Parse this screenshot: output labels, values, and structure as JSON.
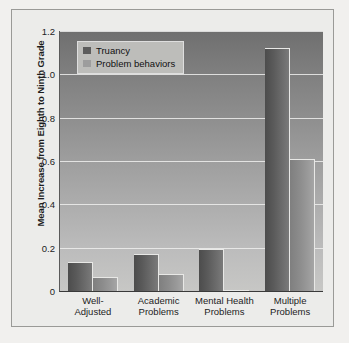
{
  "chart_data": {
    "type": "bar",
    "title": "",
    "xlabel": "",
    "ylabel": "Mean Increase from Eighth to Ninth Grade",
    "ylim": [
      0,
      1.2
    ],
    "yticks": [
      "0",
      "0.2",
      "0.4",
      "0.6",
      "0.8",
      "1.0",
      "1.2"
    ],
    "ytick_values": [
      0,
      0.2,
      0.4,
      0.6,
      0.8,
      1.0,
      1.2
    ],
    "grid": true,
    "legend_position": "top-left inside plot",
    "categories": [
      "Well-Adjusted",
      "Academic Problems",
      "Mental Health Problems",
      "Multiple Problems"
    ],
    "category_lines": [
      [
        "Well-",
        "Adjusted"
      ],
      [
        "Academic",
        "Problems"
      ],
      [
        "Mental Health",
        "Problems"
      ],
      [
        "Multiple",
        "Problems"
      ]
    ],
    "series": [
      {
        "name": "Truancy",
        "color": "#5c5c5c",
        "values": [
          0.135,
          0.17,
          0.195,
          1.12
        ]
      },
      {
        "name": "Problem behaviors",
        "color": "#9d9d9d",
        "values": [
          0.065,
          0.08,
          0.005,
          0.61
        ]
      }
    ]
  },
  "legend": {
    "items": [
      {
        "label": "Truancy"
      },
      {
        "label": "Problem behaviors"
      }
    ]
  },
  "colors": {
    "page_background": "#f1f0ee",
    "figure_background": "#ececea",
    "figure_border": "#9a9a97",
    "plot_top": "#6f6f6f",
    "plot_bottom": "#c7c7c5",
    "gridline": "#efefed",
    "truancy_bar": "#5c5c5c",
    "problem_bar": "#9d9d9d",
    "text": "#1d1d1d"
  }
}
